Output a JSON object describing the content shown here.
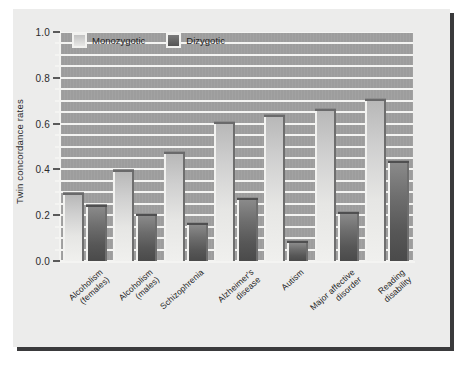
{
  "chart_data": {
    "type": "bar",
    "title": "",
    "xlabel": "",
    "ylabel": "Twin concordance rates",
    "ylim": [
      0.0,
      1.0
    ],
    "ytick_labels": [
      "0.0",
      "0.2",
      "0.4",
      "0.6",
      "0.8",
      "1.0"
    ],
    "ytick_values": [
      0.0,
      0.2,
      0.4,
      0.6,
      0.8,
      1.0
    ],
    "grid": "horizontal",
    "grid_step": 0.05,
    "legend_position": "top-left",
    "categories": [
      "Alcoholism\n(females)",
      "Alcoholism\n(males)",
      "Schizophrenia",
      "Alzheimer's\ndisease",
      "Autism",
      "Major affective\ndisorder",
      "Reading\ndisability"
    ],
    "series": [
      {
        "name": "Monozygotic",
        "color": "#d8d8d6",
        "values": [
          0.3,
          0.4,
          0.48,
          0.61,
          0.64,
          0.67,
          0.71
        ]
      },
      {
        "name": "Dizygotic",
        "color": "#5c5c5c",
        "values": [
          0.25,
          0.21,
          0.17,
          0.28,
          0.09,
          0.22,
          0.44
        ]
      }
    ]
  },
  "legend": {
    "items": [
      {
        "label": "Monozygotic",
        "swatch": "mz"
      },
      {
        "label": "Dizygotic",
        "swatch": "dz"
      }
    ]
  },
  "axis": {
    "y_title": "Twin concordance rates"
  },
  "colors": {
    "plot_background": "#9d9d9d",
    "card_background": "#ececeb",
    "gridline": "#f4f4f2",
    "page_background": "#ffffff",
    "shadow": "#3a3a3c",
    "monozygotic": "#d8d8d6",
    "dizygotic": "#5c5c5c"
  }
}
